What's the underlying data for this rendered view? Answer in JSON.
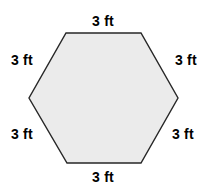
{
  "figure": {
    "shape_name": "regular-hexagon",
    "fill_color": "#ebebeb",
    "stroke_color": "#272727",
    "background_color": "#ffffff",
    "stroke_width": 1.4,
    "vertices": [
      [
        66,
        33
      ],
      [
        141,
        33
      ],
      [
        178,
        98
      ],
      [
        141,
        163
      ],
      [
        67,
        163
      ],
      [
        29,
        98
      ]
    ]
  },
  "labels": {
    "top": "3 ft",
    "right_upper": "3 ft",
    "right_lower": "3 ft",
    "bottom": "3 ft",
    "left_lower": "3 ft",
    "left_upper": "3 ft"
  }
}
